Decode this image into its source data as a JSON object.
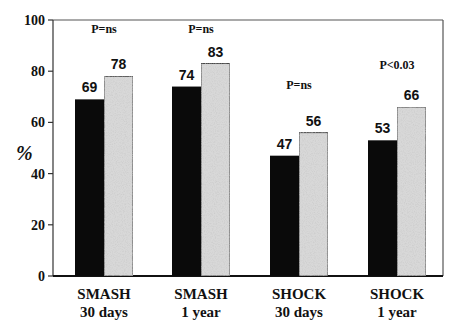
{
  "chart_data": {
    "type": "bar",
    "title": "",
    "xlabel": "",
    "ylabel": "%",
    "ylim": [
      0,
      100
    ],
    "yticks": [
      0,
      20,
      40,
      60,
      80,
      100
    ],
    "grid": false,
    "legend": null,
    "categories": [
      "SMASH 30 days",
      "SMASH 1 year",
      "SHOCK 30 days",
      "SHOCK 1 year"
    ],
    "category_lines": [
      [
        "SMASH",
        "30 days"
      ],
      [
        "SMASH",
        "1 year"
      ],
      [
        "SHOCK",
        "30 days"
      ],
      [
        "SHOCK",
        "1 year"
      ]
    ],
    "series": [
      {
        "name": "Series 1 (black)",
        "color": "#0a0a0a",
        "values": [
          69,
          74,
          47,
          53
        ]
      },
      {
        "name": "Series 2 (stippled gray)",
        "color": "#d8d8d8",
        "values": [
          78,
          83,
          56,
          66
        ]
      }
    ],
    "annotations": [
      "P=ns",
      "P=ns",
      "P=ns",
      "P<0.03"
    ],
    "annotation_y": [
      95,
      95,
      73,
      81
    ]
  }
}
